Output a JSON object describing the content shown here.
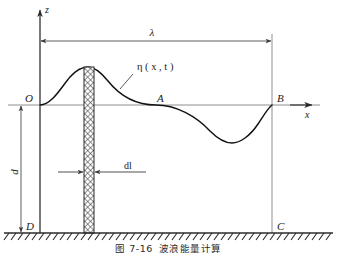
{
  "figure": {
    "caption_number": "图 7-16",
    "caption_text": "波浪能量计算",
    "axes": {
      "z_label": "z",
      "x_label": "x"
    },
    "points": {
      "origin": "O",
      "mid_crossing": "A",
      "right_surface": "B",
      "bottom_right": "C",
      "bottom_left": "D"
    },
    "annotations": {
      "wavelength": "λ",
      "surface_elevation": "η ( x , t )",
      "depth": "d",
      "element_width": "dl"
    },
    "colors": {
      "curve": "#111111",
      "axis": "#6d6d6d",
      "dimension": "#4a4a4a",
      "hatch": "#3b3b3b",
      "seabed": "#2b2b2b",
      "background": "#ffffff"
    },
    "geometry": {
      "wavelength_px": 232,
      "amplitude_px": 38,
      "depth_px": 134,
      "element_width_px": 10
    }
  }
}
